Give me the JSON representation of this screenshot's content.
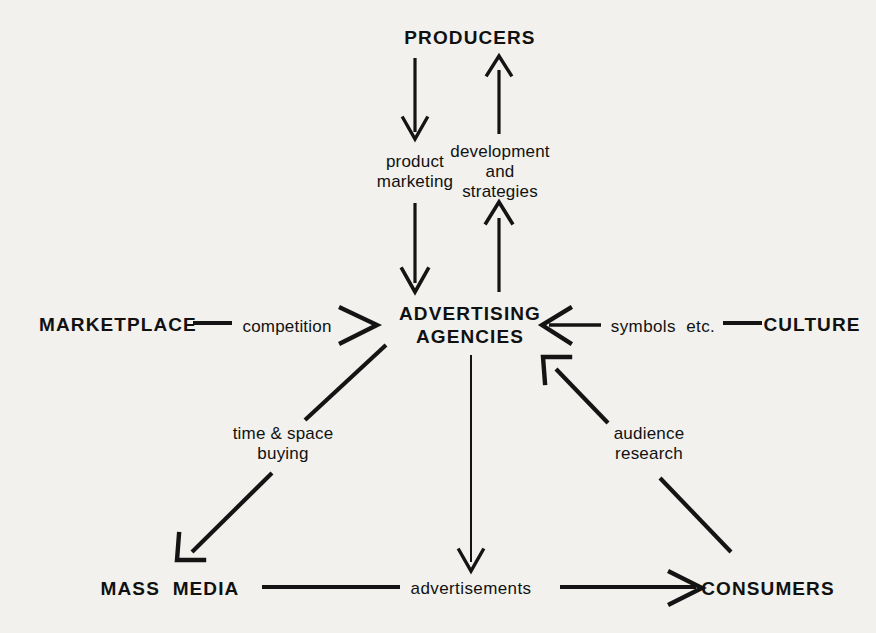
{
  "diagram": {
    "background_color": "#f2f1ee",
    "ink_color": "#111111",
    "nodes": [
      {
        "id": "producers",
        "label": "PRODUCERS",
        "x": 470,
        "y": 38,
        "style": "bold-caps"
      },
      {
        "id": "marketplace",
        "label": "MARKETPLACE",
        "x": 118,
        "y": 325,
        "style": "bold-caps"
      },
      {
        "id": "agencies",
        "label": "ADVERTISING\nAGENCIES",
        "x": 470,
        "y": 325,
        "style": "bold-caps"
      },
      {
        "id": "culture",
        "label": "CULTURE",
        "x": 812,
        "y": 325,
        "style": "bold-caps"
      },
      {
        "id": "mass_media",
        "label": "MASS  MEDIA",
        "x": 170,
        "y": 589,
        "style": "bold-caps"
      },
      {
        "id": "consumers",
        "label": "CONSUMERS",
        "x": 768,
        "y": 589,
        "style": "bold-caps"
      }
    ],
    "edge_labels": [
      {
        "id": "product_marketing",
        "label": "product\nmarketing",
        "x": 415,
        "y": 172,
        "align": "center"
      },
      {
        "id": "development_strategies",
        "label": "development\nand\nstrategies",
        "x": 500,
        "y": 172,
        "align": "center"
      },
      {
        "id": "competition",
        "label": "competition",
        "x": 287,
        "y": 327
      },
      {
        "id": "symbols_etc",
        "label": "symbols  etc.",
        "x": 663,
        "y": 327
      },
      {
        "id": "time_space_buying",
        "label": "time & space\nbuying",
        "x": 283,
        "y": 444
      },
      {
        "id": "audience_research",
        "label": "audience\nresearch",
        "x": 649,
        "y": 444
      },
      {
        "id": "advertisements",
        "label": "advertisements",
        "x": 471,
        "y": 589
      }
    ],
    "edges": [
      {
        "id": "producers-to-agencies-left",
        "from": "producers",
        "to": "agencies",
        "label": "product marketing",
        "direction": "down"
      },
      {
        "id": "agencies-to-producers-right",
        "from": "agencies",
        "to": "producers",
        "label": "development and strategies",
        "direction": "up"
      },
      {
        "id": "marketplace-to-agencies",
        "from": "marketplace",
        "to": "agencies",
        "label": "competition",
        "direction": "right"
      },
      {
        "id": "culture-to-agencies",
        "from": "culture",
        "to": "agencies",
        "label": "symbols etc.",
        "direction": "left"
      },
      {
        "id": "agencies-to-massmedia",
        "from": "agencies",
        "to": "mass_media",
        "label": "time & space buying",
        "direction": "down-left"
      },
      {
        "id": "consumers-to-agencies",
        "from": "consumers",
        "to": "agencies",
        "label": "audience research",
        "direction": "up-left"
      },
      {
        "id": "agencies-to-advertisements",
        "from": "agencies",
        "to": "advertisements",
        "label": "advertisements",
        "direction": "down"
      },
      {
        "id": "massmedia-to-advertisements",
        "from": "mass_media",
        "to": "advertisements",
        "label": "",
        "direction": "right-plain"
      },
      {
        "id": "advertisements-to-consumers",
        "from": "advertisements",
        "to": "consumers",
        "label": "",
        "direction": "right"
      }
    ]
  }
}
